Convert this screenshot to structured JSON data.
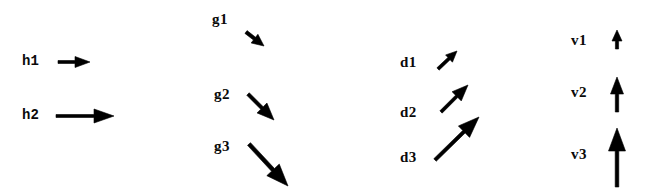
{
  "figure": {
    "background_color": "#ffffff",
    "ink_color": "#000000",
    "width": 646,
    "height": 195
  },
  "groups": [
    {
      "name": "h-vectors",
      "direction": "right",
      "items": [
        {
          "label": "h1",
          "label_x": 22,
          "label_y": 54,
          "x1": 58,
          "y1": 62,
          "x2": 90,
          "y2": 62,
          "shaft_width": 3.0,
          "head_length": 15,
          "head_width": 11
        },
        {
          "label": "h2",
          "label_x": 22,
          "label_y": 108,
          "x1": 56,
          "y1": 116,
          "x2": 114,
          "y2": 116,
          "shaft_width": 3.0,
          "head_length": 20,
          "head_width": 14
        }
      ]
    },
    {
      "name": "g-vectors",
      "direction": "down-right",
      "items": [
        {
          "label": "g1",
          "label_x": 212,
          "label_y": 12,
          "x1": 246,
          "y1": 32,
          "x2": 264,
          "y2": 46,
          "shaft_width": 3.5,
          "head_length": 12,
          "head_width": 11
        },
        {
          "label": "g2",
          "label_x": 214,
          "label_y": 87,
          "x1": 248,
          "y1": 94,
          "x2": 274,
          "y2": 120,
          "shaft_width": 3.5,
          "head_length": 17,
          "head_width": 14
        },
        {
          "label": "g3",
          "label_x": 214,
          "label_y": 139,
          "x1": 249,
          "y1": 144,
          "x2": 288,
          "y2": 186,
          "shaft_width": 4.0,
          "head_length": 22,
          "head_width": 17
        }
      ]
    },
    {
      "name": "d-vectors",
      "direction": "up-right",
      "items": [
        {
          "label": "d1",
          "label_x": 400,
          "label_y": 55,
          "x1": 438,
          "y1": 69,
          "x2": 457,
          "y2": 51,
          "shaft_width": 3.2,
          "head_length": 11,
          "head_width": 10
        },
        {
          "label": "d2",
          "label_x": 400,
          "label_y": 105,
          "x1": 441,
          "y1": 112,
          "x2": 468,
          "y2": 85,
          "shaft_width": 3.2,
          "head_length": 16,
          "head_width": 13
        },
        {
          "label": "d3",
          "label_x": 400,
          "label_y": 150,
          "x1": 435,
          "y1": 160,
          "x2": 479,
          "y2": 117,
          "shaft_width": 3.5,
          "head_length": 21,
          "head_width": 16
        }
      ]
    },
    {
      "name": "v-vectors",
      "direction": "up",
      "items": [
        {
          "label": "v1",
          "label_x": 571,
          "label_y": 33,
          "x1": 617,
          "y1": 49,
          "x2": 617,
          "y2": 30,
          "shaft_width": 3.2,
          "head_length": 11,
          "head_width": 10
        },
        {
          "label": "v2",
          "label_x": 571,
          "label_y": 85,
          "x1": 617,
          "y1": 112,
          "x2": 617,
          "y2": 77,
          "shaft_width": 3.4,
          "head_length": 17,
          "head_width": 13
        },
        {
          "label": "v3",
          "label_x": 571,
          "label_y": 147,
          "x1": 617,
          "y1": 187,
          "x2": 617,
          "y2": 128,
          "shaft_width": 3.6,
          "head_length": 23,
          "head_width": 17
        }
      ]
    }
  ]
}
